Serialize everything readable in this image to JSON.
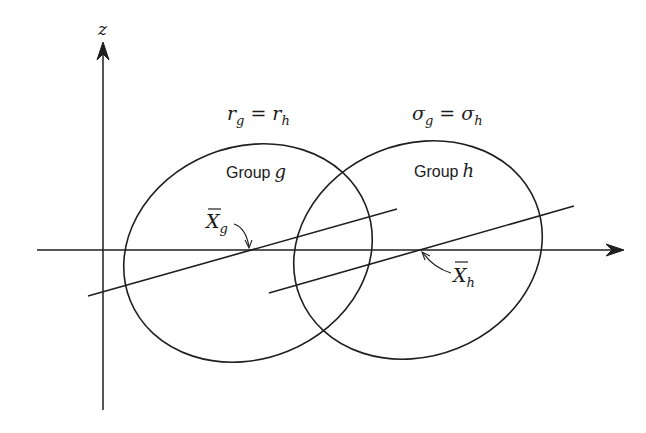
{
  "figure": {
    "axes": {
      "vertical_label": "z",
      "has_horizontal_arrow": true,
      "has_vertical_arrow": true
    },
    "conditions": {
      "left": {
        "base": "r",
        "sub1": "g",
        "op": "=",
        "base2": "r",
        "sub2": "h"
      },
      "right": {
        "base": "σ",
        "sub1": "g",
        "op": "=",
        "base2": "σ",
        "sub2": "h"
      }
    },
    "groups": [
      {
        "label_prefix": "Group",
        "label_var": "g",
        "mean_symbol": "X",
        "mean_sub": "g"
      },
      {
        "label_prefix": "Group",
        "label_var": "h",
        "mean_symbol": "X",
        "mean_sub": "h"
      }
    ],
    "colors": {
      "ink": "#1f1f1f",
      "background": "#ffffff"
    }
  }
}
